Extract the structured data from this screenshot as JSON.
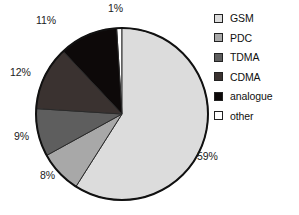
{
  "chart_data": {
    "type": "pie",
    "title": "",
    "categories": [
      "GSM",
      "PDC",
      "TDMA",
      "CDMA",
      "analogue",
      "other"
    ],
    "values": [
      59,
      8,
      9,
      12,
      11,
      1
    ],
    "unit": "%",
    "value_labels": [
      "59%",
      "8%",
      "9%",
      "12%",
      "11%",
      "1%"
    ],
    "colors": [
      "#dcdcdc",
      "#a8a8a8",
      "#5e5e5e",
      "#3a3230",
      "#0d0909",
      "#ffffff"
    ],
    "legend_position": "right",
    "grid": false,
    "start_angle_deg": -3.6,
    "direction": "clockwise",
    "slices": [
      {
        "label": "other",
        "value": 1,
        "value_label": "1%",
        "color": "#ffffff"
      },
      {
        "label": "GSM",
        "value": 59,
        "value_label": "59%",
        "color": "#dcdcdc"
      },
      {
        "label": "PDC",
        "value": 8,
        "value_label": "8%",
        "color": "#a8a8a8"
      },
      {
        "label": "TDMA",
        "value": 9,
        "value_label": "9%",
        "color": "#5e5e5e"
      },
      {
        "label": "CDMA",
        "value": 12,
        "value_label": "12%",
        "color": "#3a3230"
      },
      {
        "label": "analogue",
        "value": 11,
        "value_label": "11%",
        "color": "#0d0909"
      }
    ]
  },
  "pie": {
    "labels": {
      "other": "1%",
      "analogue": "11%",
      "cdma": "12%",
      "tdma": "9%",
      "pdc": "8%",
      "gsm": "59%"
    }
  },
  "legend": {
    "items": [
      {
        "label": "GSM",
        "color": "#dcdcdc"
      },
      {
        "label": "PDC",
        "color": "#a8a8a8"
      },
      {
        "label": "TDMA",
        "color": "#5e5e5e"
      },
      {
        "label": "CDMA",
        "color": "#3a3230"
      },
      {
        "label": "analogue",
        "color": "#0d0909"
      },
      {
        "label": "other",
        "color": "#ffffff"
      }
    ]
  },
  "style": {
    "outline": "#111111",
    "background": "#ffffff",
    "text": "#101010"
  }
}
